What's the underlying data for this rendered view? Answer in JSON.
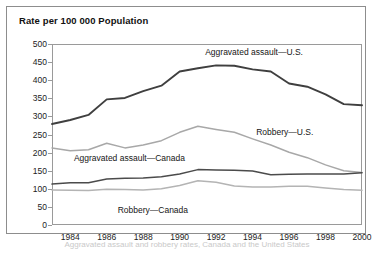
{
  "figure": {
    "title": "Rate per 100 000 Population",
    "caption_partial": "Aggravated assault and robbery rates, Canada and the United States"
  },
  "chart_data": {
    "type": "line",
    "title": "Rate per 100 000 Population",
    "xlabel": "",
    "ylabel": "Rate per 100 000 Population",
    "xlim": [
      1983,
      2000
    ],
    "ylim": [
      0,
      500
    ],
    "ytick_interval": 50,
    "grid": false,
    "legend_position": "inline-annotations",
    "yticks": [
      500,
      450,
      400,
      350,
      300,
      250,
      200,
      150,
      100,
      50,
      0
    ],
    "xticks": [
      1984,
      1986,
      1988,
      1990,
      1992,
      1994,
      1996,
      1998,
      2000
    ],
    "x": [
      1983,
      1984,
      1985,
      1986,
      1987,
      1988,
      1989,
      1990,
      1991,
      1992,
      1993,
      1994,
      1995,
      1996,
      1997,
      1998,
      1999,
      2000
    ],
    "series": [
      {
        "name": "Aggravated assault—U.S.",
        "color": "#3f3f3f",
        "width": 1.9,
        "label_x": 1991.4,
        "label_y": 478,
        "values": [
          279,
          290,
          304,
          347,
          351,
          370,
          385,
          424,
          433,
          441,
          440,
          430,
          424,
          391,
          382,
          361,
          334,
          331
        ]
      },
      {
        "name": "Robbery—U.S.",
        "color": "#a8a8a8",
        "width": 1.5,
        "label_x": 1994.2,
        "label_y": 258,
        "values": [
          213,
          205,
          208,
          226,
          213,
          221,
          233,
          256,
          273,
          264,
          256,
          238,
          221,
          201,
          186,
          166,
          150,
          145
        ]
      },
      {
        "name": "Aggravated assault—Canada",
        "color": "#4b4b4b",
        "width": 1.5,
        "label_x": 1984.2,
        "label_y": 186,
        "values": [
          113,
          117,
          117,
          127,
          129,
          130,
          133,
          141,
          153,
          152,
          151,
          149,
          139,
          140,
          141,
          141,
          141,
          144
        ]
      },
      {
        "name": "Robbery—Canada",
        "color": "#b4b4b4",
        "width": 1.5,
        "label_x": 1986.6,
        "label_y": 42,
        "values": [
          97,
          96,
          95,
          99,
          98,
          97,
          100,
          109,
          122,
          118,
          108,
          105,
          105,
          107,
          107,
          102,
          98,
          96
        ]
      }
    ]
  }
}
